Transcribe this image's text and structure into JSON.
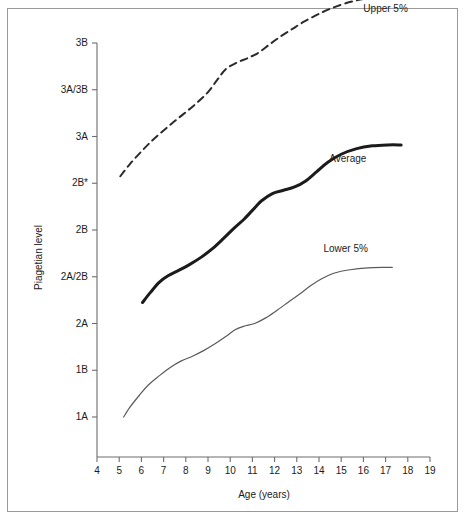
{
  "chart_data": {
    "type": "line",
    "title": "",
    "xlabel": "Age (years)",
    "ylabel": "Piagetian level",
    "xlim": [
      4,
      19
    ],
    "ylim_labels": [
      "1A",
      "1B",
      "2A",
      "2A/2B",
      "2B",
      "2B*",
      "3A",
      "3A/3B",
      "3B"
    ],
    "grid": false,
    "legend_position": "inline-annotations",
    "x_ticks": [
      "4",
      "5",
      "6",
      "7",
      "8",
      "9",
      "10",
      "11",
      "12",
      "13",
      "14",
      "15",
      "16",
      "17",
      "18",
      "19"
    ],
    "y_ticks": [
      "3B",
      "3A/3B",
      "3A",
      "2B*",
      "2B",
      "2A/2B",
      "2A",
      "1B",
      "1A"
    ],
    "y_tick_index": {
      "1A": 0,
      "1B": 1,
      "2A": 2,
      "2A/2B": 3,
      "2B": 4,
      "2B*": 5,
      "3A": 6,
      "3A/3B": 7,
      "3B": 8
    },
    "series": [
      {
        "name": "Upper 5%",
        "style": "dashed",
        "color": "#2b2b2b",
        "width": 2.0,
        "label_x": 17.0,
        "label_y": 8.75,
        "points": [
          {
            "x": 5.05,
            "y": 5.15
          },
          {
            "x": 5.5,
            "y": 5.42
          },
          {
            "x": 6.0,
            "y": 5.68
          },
          {
            "x": 6.5,
            "y": 5.92
          },
          {
            "x": 7.0,
            "y": 6.13
          },
          {
            "x": 7.5,
            "y": 6.33
          },
          {
            "x": 8.0,
            "y": 6.52
          },
          {
            "x": 8.5,
            "y": 6.72
          },
          {
            "x": 9.0,
            "y": 6.95
          },
          {
            "x": 9.4,
            "y": 7.2
          },
          {
            "x": 9.8,
            "y": 7.44
          },
          {
            "x": 10.3,
            "y": 7.58
          },
          {
            "x": 10.8,
            "y": 7.68
          },
          {
            "x": 11.3,
            "y": 7.8
          },
          {
            "x": 11.8,
            "y": 7.98
          },
          {
            "x": 12.3,
            "y": 8.15
          },
          {
            "x": 12.8,
            "y": 8.3
          },
          {
            "x": 13.3,
            "y": 8.45
          },
          {
            "x": 13.9,
            "y": 8.6
          },
          {
            "x": 14.5,
            "y": 8.73
          },
          {
            "x": 15.2,
            "y": 8.85
          },
          {
            "x": 16.0,
            "y": 8.94
          },
          {
            "x": 16.8,
            "y": 8.99
          },
          {
            "x": 17.6,
            "y": 9.02
          }
        ]
      },
      {
        "name": "Average",
        "style": "solid",
        "color": "#1b1b1b",
        "width": 3.0,
        "label_x": 15.3,
        "label_y": 5.55,
        "points": [
          {
            "x": 6.05,
            "y": 2.45
          },
          {
            "x": 6.4,
            "y": 2.66
          },
          {
            "x": 6.8,
            "y": 2.88
          },
          {
            "x": 7.2,
            "y": 3.02
          },
          {
            "x": 7.7,
            "y": 3.14
          },
          {
            "x": 8.2,
            "y": 3.27
          },
          {
            "x": 8.7,
            "y": 3.42
          },
          {
            "x": 9.2,
            "y": 3.6
          },
          {
            "x": 9.7,
            "y": 3.82
          },
          {
            "x": 10.2,
            "y": 4.05
          },
          {
            "x": 10.6,
            "y": 4.22
          },
          {
            "x": 11.0,
            "y": 4.42
          },
          {
            "x": 11.4,
            "y": 4.62
          },
          {
            "x": 11.9,
            "y": 4.78
          },
          {
            "x": 12.4,
            "y": 4.85
          },
          {
            "x": 12.9,
            "y": 4.92
          },
          {
            "x": 13.4,
            "y": 5.05
          },
          {
            "x": 13.9,
            "y": 5.25
          },
          {
            "x": 14.4,
            "y": 5.45
          },
          {
            "x": 15.0,
            "y": 5.62
          },
          {
            "x": 15.7,
            "y": 5.74
          },
          {
            "x": 16.4,
            "y": 5.8
          },
          {
            "x": 17.1,
            "y": 5.82
          },
          {
            "x": 17.7,
            "y": 5.82
          }
        ]
      },
      {
        "name": "Lower 5%",
        "style": "solid",
        "color": "#5a5a5a",
        "width": 1.2,
        "label_x": 15.2,
        "label_y": 3.62,
        "points": [
          {
            "x": 5.2,
            "y": 0.0
          },
          {
            "x": 5.5,
            "y": 0.22
          },
          {
            "x": 5.9,
            "y": 0.46
          },
          {
            "x": 6.3,
            "y": 0.68
          },
          {
            "x": 6.8,
            "y": 0.88
          },
          {
            "x": 7.3,
            "y": 1.06
          },
          {
            "x": 7.8,
            "y": 1.2
          },
          {
            "x": 8.3,
            "y": 1.3
          },
          {
            "x": 8.8,
            "y": 1.42
          },
          {
            "x": 9.3,
            "y": 1.56
          },
          {
            "x": 9.8,
            "y": 1.72
          },
          {
            "x": 10.2,
            "y": 1.86
          },
          {
            "x": 10.6,
            "y": 1.94
          },
          {
            "x": 11.1,
            "y": 2.0
          },
          {
            "x": 11.6,
            "y": 2.12
          },
          {
            "x": 12.1,
            "y": 2.28
          },
          {
            "x": 12.6,
            "y": 2.45
          },
          {
            "x": 13.1,
            "y": 2.62
          },
          {
            "x": 13.6,
            "y": 2.8
          },
          {
            "x": 14.1,
            "y": 2.95
          },
          {
            "x": 14.7,
            "y": 3.08
          },
          {
            "x": 15.4,
            "y": 3.15
          },
          {
            "x": 16.2,
            "y": 3.19
          },
          {
            "x": 17.0,
            "y": 3.2
          },
          {
            "x": 17.3,
            "y": 3.2
          }
        ]
      }
    ]
  },
  "axes": {
    "x_title": "Age (years)",
    "y_title": "Piagetian level"
  },
  "annotations": {
    "upper": "Upper 5%",
    "average": "Average",
    "lower": "Lower 5%"
  }
}
